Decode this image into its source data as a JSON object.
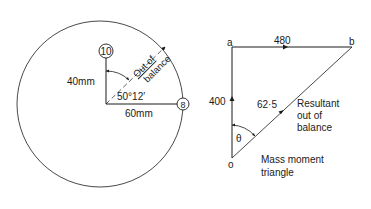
{
  "unbalance_diagram": {
    "mass_top": "10",
    "mass_right": "8",
    "radius_top": "40mm",
    "radius_right": "60mm",
    "angle": "50°12′",
    "resultant_label_line1": "Out of",
    "resultant_label_line2": "balance"
  },
  "mass_moment_triangle": {
    "vertex_a": "a",
    "vertex_b": "b",
    "vertex_o": "o",
    "side_ab": "480",
    "side_oa": "400",
    "side_ob": "62·5",
    "angle_label": "θ",
    "resultant_line1": "Resultant",
    "resultant_line2": "out of",
    "resultant_line3": "balance",
    "caption_line1": "Mass moment",
    "caption_line2": "triangle"
  },
  "colors": {
    "ink": "#1a1a1a",
    "background": "#ffffff"
  }
}
